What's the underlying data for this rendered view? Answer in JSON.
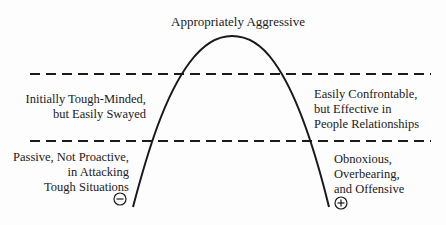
{
  "diagram": {
    "title": "Appropriately Aggressive",
    "zones": {
      "upper_left": {
        "lines": [
          "Initially Tough-Minded,",
          "but Easily Swayed"
        ]
      },
      "upper_right": {
        "lines": [
          "Easily Confrontable,",
          "but Effective in",
          "People Relationships"
        ]
      },
      "lower_left": {
        "lines": [
          "Passive, Not Proactive,",
          "in Attacking",
          "Tough Situations"
        ]
      },
      "lower_right": {
        "lines": [
          "Obnoxious,",
          "Overbearing,",
          "and Offensive"
        ]
      }
    },
    "markers": {
      "left": {
        "symbol": "minus-circle",
        "glyph": "−"
      },
      "right": {
        "symbol": "plus-circle",
        "glyph": "+"
      }
    },
    "colors": {
      "line": "#1a1a1a",
      "background": "#fdfdfd"
    }
  }
}
